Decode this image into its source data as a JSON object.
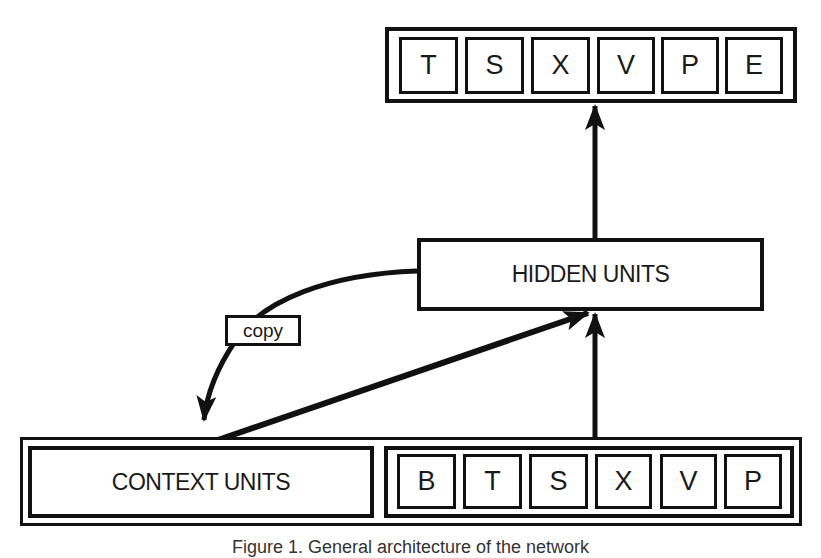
{
  "diagram": {
    "type": "simple recurrent network architecture",
    "output_layer": {
      "cells": [
        "T",
        "S",
        "X",
        "V",
        "P",
        "E"
      ]
    },
    "hidden_layer": {
      "label": "HIDDEN UNITS"
    },
    "context_layer": {
      "label": "CONTEXT UNITS"
    },
    "input_layer": {
      "cells": [
        "B",
        "T",
        "S",
        "X",
        "V",
        "P"
      ]
    },
    "connections": [
      {
        "from": "hidden_layer",
        "to": "output_layer",
        "style": "straight-arrow"
      },
      {
        "from": "input_layer",
        "to": "hidden_layer",
        "style": "straight-arrow"
      },
      {
        "from": "context_layer",
        "to": "hidden_layer",
        "style": "diagonal-arrow"
      },
      {
        "from": "hidden_layer",
        "to": "context_layer",
        "style": "curved-arrow",
        "label": "copy"
      }
    ],
    "copy_label": "copy",
    "caption": "Figure 1.  General architecture of the network",
    "colors": {
      "stroke": "#111111",
      "background": "#ffffff"
    }
  }
}
